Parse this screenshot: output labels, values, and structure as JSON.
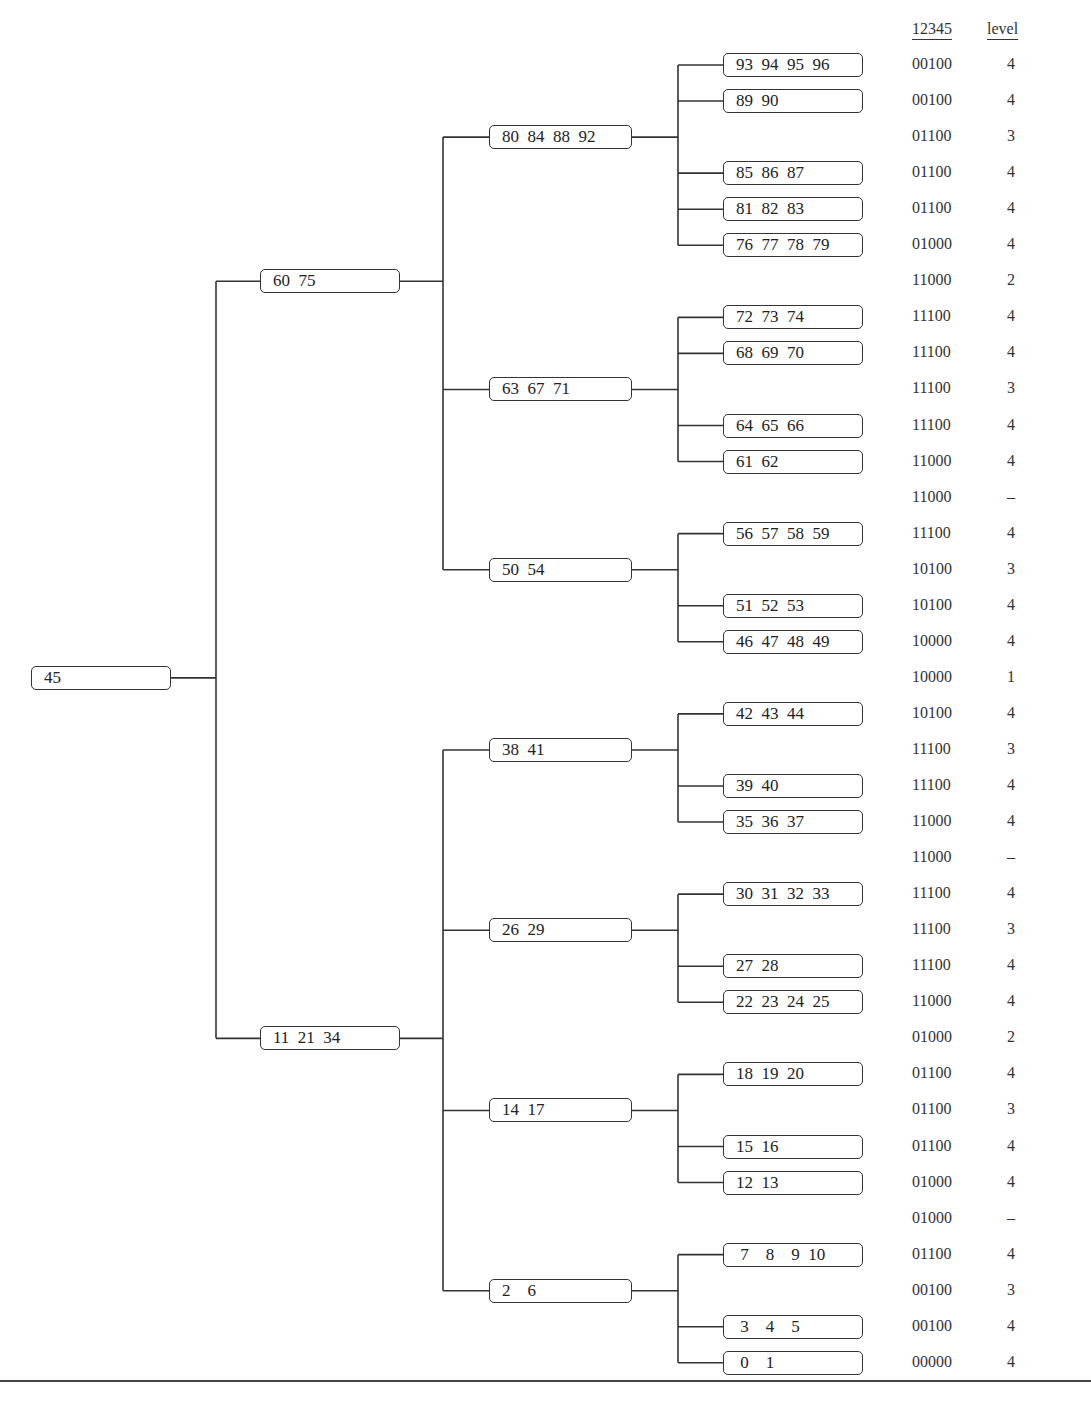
{
  "tree": {
    "label": "45",
    "children": [
      {
        "label": "60  75",
        "children": [
          {
            "label": "80  84  88  92",
            "children": [
              {
                "label": "93  94  95  96",
                "row": 0
              },
              {
                "label": "89  90",
                "row": 1
              },
              {
                "label": "85  86  87",
                "row": 3
              },
              {
                "label": "81  82  83",
                "row": 4
              },
              {
                "label": "76  77  78  79",
                "row": 5
              }
            ],
            "row": 2
          },
          {
            "label": "63  67  71",
            "children": [
              {
                "label": "72  73  74",
                "row": 7
              },
              {
                "label": "68  69  70",
                "row": 8
              },
              {
                "label": "64  65  66",
                "row": 10
              },
              {
                "label": "61  62",
                "row": 11
              }
            ],
            "row": 9
          },
          {
            "label": "50  54",
            "children": [
              {
                "label": "56  57  58  59",
                "row": 13
              },
              {
                "label": "51  52  53",
                "row": 15
              },
              {
                "label": "46  47  48  49",
                "row": 16
              }
            ],
            "row": 14
          }
        ],
        "row": 6
      },
      {
        "label": "11  21  34",
        "children": [
          {
            "label": "38  41",
            "children": [
              {
                "label": "42  43  44",
                "row": 18
              },
              {
                "label": "39  40",
                "row": 20
              },
              {
                "label": "35  36  37",
                "row": 21
              }
            ],
            "row": 19
          },
          {
            "label": "26  29",
            "children": [
              {
                "label": "30  31  32  33",
                "row": 23
              },
              {
                "label": "27  28",
                "row": 25
              },
              {
                "label": "22  23  24  25",
                "row": 26
              }
            ],
            "row": 24
          },
          {
            "label": "14  17",
            "children": [
              {
                "label": "18  19  20",
                "row": 28
              },
              {
                "label": "15  16",
                "row": 30
              },
              {
                "label": "12  13",
                "row": 31
              }
            ],
            "row": 29
          },
          {
            "label": "2    6",
            "children": [
              {
                "label": " 7    8    9  10",
                "row": 33
              },
              {
                "label": " 3    4    5",
                "row": 35
              },
              {
                "label": " 0    1",
                "row": 36
              }
            ],
            "row": 34
          }
        ],
        "row": 27
      }
    ],
    "row": 17
  },
  "table": {
    "headers": [
      "12345",
      "level"
    ],
    "rows": [
      [
        "00100",
        "4"
      ],
      [
        "00100",
        "4"
      ],
      [
        "01100",
        "3"
      ],
      [
        "01100",
        "4"
      ],
      [
        "01100",
        "4"
      ],
      [
        "01000",
        "4"
      ],
      [
        "11000",
        "2"
      ],
      [
        "11100",
        "4"
      ],
      [
        "11100",
        "4"
      ],
      [
        "11100",
        "3"
      ],
      [
        "11100",
        "4"
      ],
      [
        "11000",
        "4"
      ],
      [
        "11000",
        "–"
      ],
      [
        "11100",
        "4"
      ],
      [
        "10100",
        "3"
      ],
      [
        "10100",
        "4"
      ],
      [
        "10000",
        "4"
      ],
      [
        "10000",
        "1"
      ],
      [
        "10100",
        "4"
      ],
      [
        "11100",
        "3"
      ],
      [
        "11100",
        "4"
      ],
      [
        "11000",
        "4"
      ],
      [
        "11000",
        "–"
      ],
      [
        "11100",
        "4"
      ],
      [
        "11100",
        "3"
      ],
      [
        "11100",
        "4"
      ],
      [
        "11000",
        "4"
      ],
      [
        "01000",
        "2"
      ],
      [
        "01100",
        "4"
      ],
      [
        "01100",
        "3"
      ],
      [
        "01100",
        "4"
      ],
      [
        "01000",
        "4"
      ],
      [
        "01000",
        "–"
      ],
      [
        "01100",
        "4"
      ],
      [
        "00100",
        "3"
      ],
      [
        "00100",
        "4"
      ],
      [
        "00000",
        "4"
      ]
    ]
  }
}
